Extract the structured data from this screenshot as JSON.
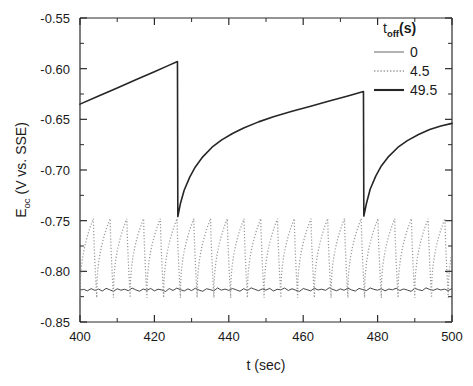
{
  "chart_data": {
    "type": "line",
    "title": "",
    "xlabel": "t (sec)",
    "ylabel_main": "E",
    "ylabel_sub": "oc",
    "ylabel_rest": " (V vs. SSE)",
    "ylabel_full": "E_oc (V vs. SSE)",
    "xlim": [
      400,
      500
    ],
    "ylim": [
      -0.85,
      -0.55
    ],
    "xticks": [
      400,
      420,
      440,
      460,
      480,
      500
    ],
    "xtick_labels": [
      "400",
      "420",
      "440",
      "460",
      "480",
      "500"
    ],
    "xminor_step": 10,
    "yticks": [
      -0.85,
      -0.8,
      -0.75,
      -0.7,
      -0.65,
      -0.6,
      -0.55
    ],
    "ytick_labels": [
      "-0.85",
      "-0.80",
      "-0.75",
      "-0.70",
      "-0.65",
      "-0.60",
      "-0.55"
    ],
    "yminor_step": 0.025,
    "grid": false,
    "legend_position": "top-right",
    "legend_title_main": "t",
    "legend_title_sub": "off",
    "legend_title_unit": "(s)",
    "legend_title_full": "t_off (s)",
    "series": [
      {
        "name": "0",
        "label": "0",
        "style": "solid-thin",
        "color": "#333333",
        "description": "flat noisy open-circuit potential near -0.818 V",
        "baseline": -0.818,
        "noise_amplitude": 0.003,
        "values": [
          -0.8185,
          -0.8178,
          -0.8192,
          -0.8171,
          -0.8188,
          -0.8175,
          -0.8195,
          -0.8168,
          -0.8182,
          -0.8198,
          -0.8172,
          -0.8186,
          -0.8177,
          -0.8191,
          -0.8165,
          -0.8183,
          -0.8196,
          -0.8174,
          -0.8187,
          -0.8169,
          -0.8193,
          -0.8176,
          -0.8184,
          -0.8199,
          -0.817,
          -0.8189,
          -0.8166,
          -0.8181,
          -0.8194,
          -0.8173,
          -0.819,
          -0.8167,
          -0.8185,
          -0.8197,
          -0.8172,
          -0.818,
          -0.8192,
          -0.8164,
          -0.8186,
          -0.8175,
          -0.8188,
          -0.8169,
          -0.8183,
          -0.8196,
          -0.8171,
          -0.819,
          -0.8163,
          -0.8178,
          -0.8191,
          -0.8174,
          -0.8185,
          -0.8168,
          -0.8194,
          -0.8177,
          -0.8182,
          -0.8165,
          -0.8189,
          -0.8172,
          -0.8186,
          -0.8198,
          -0.817,
          -0.8181,
          -0.8193,
          -0.8167,
          -0.8184,
          -0.8176,
          -0.8188,
          -0.8162,
          -0.8179,
          -0.8192,
          -0.8173,
          -0.8187,
          -0.8166,
          -0.8183,
          -0.8195,
          -0.8169,
          -0.818,
          -0.819,
          -0.8164,
          -0.8178,
          -0.8186,
          -0.8171,
          -0.8193,
          -0.8175,
          -0.8182,
          -0.8167,
          -0.8189,
          -0.8174,
          -0.8185,
          -0.8197,
          -0.8168,
          -0.8181,
          -0.8191,
          -0.8163,
          -0.8179,
          -0.8187,
          -0.8172,
          -0.8184,
          -0.8176,
          -0.819,
          -0.817
        ]
      },
      {
        "name": "4.5",
        "label": "4.5",
        "style": "dotted",
        "color": "#9a9a9a",
        "description": "sawtooth oscillation, period 4.5 s, rising from -0.825 to peak -0.748 then sharp drop",
        "period": 4.5,
        "peak": -0.748,
        "trough": -0.826,
        "phase_start": 400.0
      },
      {
        "name": "49.5",
        "label": "49.5",
        "style": "solid-thick",
        "color": "#262626",
        "description": "long-period sawtooth; slow logarithmic rise then sharp drop at t=426 and t=476",
        "period": 50.0,
        "drop_times": [
          426.2,
          476.2
        ],
        "points": [
          [
            400.0,
            -0.635
          ],
          [
            405.0,
            -0.627
          ],
          [
            410.0,
            -0.619
          ],
          [
            415.0,
            -0.611
          ],
          [
            420.0,
            -0.603
          ],
          [
            424.0,
            -0.5965
          ],
          [
            426.2,
            -0.593
          ],
          [
            426.3,
            -0.746
          ],
          [
            427.0,
            -0.733
          ],
          [
            428.0,
            -0.72
          ],
          [
            429.5,
            -0.707
          ],
          [
            431.0,
            -0.697
          ],
          [
            433.0,
            -0.687
          ],
          [
            435.5,
            -0.6775
          ],
          [
            438.0,
            -0.6705
          ],
          [
            441.0,
            -0.664
          ],
          [
            444.0,
            -0.6585
          ],
          [
            448.0,
            -0.6525
          ],
          [
            452.0,
            -0.6475
          ],
          [
            457.0,
            -0.642
          ],
          [
            462.0,
            -0.637
          ],
          [
            467.0,
            -0.632
          ],
          [
            472.0,
            -0.627
          ],
          [
            476.2,
            -0.6225
          ],
          [
            476.3,
            -0.7455
          ],
          [
            477.0,
            -0.733
          ],
          [
            478.0,
            -0.719
          ],
          [
            479.5,
            -0.706
          ],
          [
            481.0,
            -0.696
          ],
          [
            483.0,
            -0.6865
          ],
          [
            485.5,
            -0.6775
          ],
          [
            488.0,
            -0.671
          ],
          [
            491.0,
            -0.665
          ],
          [
            494.0,
            -0.66
          ],
          [
            497.0,
            -0.6565
          ],
          [
            500.0,
            -0.654
          ]
        ]
      }
    ]
  }
}
